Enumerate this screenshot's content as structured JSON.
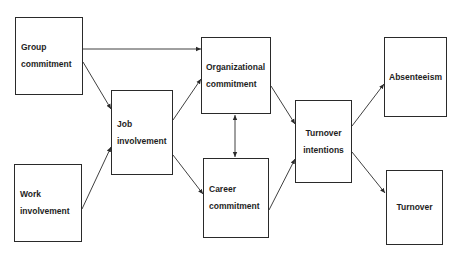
{
  "diagram": {
    "nodes": [
      {
        "id": "group",
        "lines": [
          "Group",
          "commitment"
        ]
      },
      {
        "id": "work",
        "lines": [
          "Work",
          "involvement"
        ]
      },
      {
        "id": "job",
        "lines": [
          "Job",
          "involvement"
        ]
      },
      {
        "id": "org",
        "lines": [
          "Organizational",
          "commitment"
        ]
      },
      {
        "id": "career",
        "lines": [
          "Career",
          "commitment"
        ]
      },
      {
        "id": "intentions",
        "lines": [
          "Turnover",
          "intentions"
        ]
      },
      {
        "id": "absenteeism",
        "lines": [
          "Absenteeism"
        ]
      },
      {
        "id": "turnover",
        "lines": [
          "Turnover"
        ]
      }
    ],
    "edges": [
      {
        "from": "Group commitment",
        "to": "Organizational commitment"
      },
      {
        "from": "Group commitment",
        "to": "Job involvement"
      },
      {
        "from": "Work involvement",
        "to": "Job involvement"
      },
      {
        "from": "Job involvement",
        "to": "Organizational commitment"
      },
      {
        "from": "Job involvement",
        "to": "Career commitment"
      },
      {
        "from": "Organizational commitment",
        "to": "Career commitment",
        "bidirectional": true
      },
      {
        "from": "Organizational commitment",
        "to": "Turnover intentions"
      },
      {
        "from": "Career commitment",
        "to": "Turnover intentions"
      },
      {
        "from": "Turnover intentions",
        "to": "Absenteeism"
      },
      {
        "from": "Turnover intentions",
        "to": "Turnover"
      }
    ],
    "colors": {
      "line": "#2a2a2a",
      "text": "#1e1e1e",
      "background": "#ffffff"
    }
  }
}
